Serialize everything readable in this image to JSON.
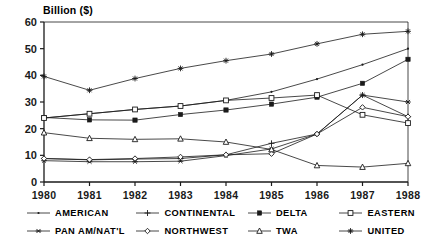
{
  "chart_data": {
    "type": "line",
    "title": "",
    "ylabel": "Billion ($)",
    "xlabel": "",
    "ylim": [
      0,
      60
    ],
    "yticks": [
      0,
      10,
      20,
      30,
      40,
      50,
      60
    ],
    "grid": false,
    "legend_position": "bottom",
    "categories": [
      "1980",
      "1981",
      "1982",
      "1983",
      "1984",
      "1985",
      "1986",
      "1987",
      "1988"
    ],
    "x": [
      1980,
      1981,
      1982,
      1983,
      1984,
      1985,
      1986,
      1987,
      1988
    ],
    "series": [
      {
        "name": "AMERICAN",
        "marker": "dot",
        "values": [
          24.0,
          25.6,
          27.2,
          28.5,
          30.6,
          33.8,
          38.6,
          44.0,
          50.0
        ]
      },
      {
        "name": "CONTINENTAL",
        "marker": "plus",
        "values": [
          8.8,
          8.3,
          8.6,
          8.8,
          10.2,
          14.5,
          18.0,
          32.6,
          24.5
        ]
      },
      {
        "name": "DELTA",
        "marker": "filled-square",
        "values": [
          24.2,
          23.3,
          23.2,
          25.3,
          27.0,
          29.2,
          31.8,
          37.0,
          46.0
        ]
      },
      {
        "name": "EASTERN",
        "marker": "open-square",
        "values": [
          24.0,
          25.6,
          27.2,
          28.5,
          30.6,
          31.5,
          32.6,
          25.2,
          22.1
        ]
      },
      {
        "name": "PAN AM/NAT'L",
        "marker": "asterisk",
        "values": [
          8.0,
          7.6,
          7.6,
          7.8,
          9.9,
          12.4,
          18.0,
          32.6,
          30.0
        ]
      },
      {
        "name": "NORTHWEST",
        "marker": "open-diamond",
        "values": [
          8.8,
          8.4,
          8.8,
          9.4,
          10.2,
          10.6,
          18.0,
          28.0,
          24.5
        ]
      },
      {
        "name": "TWA",
        "marker": "open-triangle",
        "values": [
          18.5,
          16.4,
          16.0,
          16.2,
          15.0,
          12.2,
          6.2,
          5.6,
          7.0
        ]
      },
      {
        "name": "UNITED",
        "marker": "star",
        "values": [
          39.6,
          34.4,
          38.8,
          42.6,
          45.5,
          48.0,
          51.8,
          55.4,
          56.5
        ]
      }
    ]
  },
  "legend": {
    "rows": [
      [
        {
          "label": "AMERICAN",
          "marker": "dot"
        },
        {
          "label": "CONTINENTAL",
          "marker": "plus"
        },
        {
          "label": "DELTA",
          "marker": "filled-square"
        },
        {
          "label": "EASTERN",
          "marker": "open-square"
        }
      ],
      [
        {
          "label": "PAN AM/NAT'L",
          "marker": "asterisk"
        },
        {
          "label": "NORTHWEST",
          "marker": "open-diamond"
        },
        {
          "label": "TWA",
          "marker": "open-triangle"
        },
        {
          "label": "UNITED",
          "marker": "star"
        }
      ]
    ]
  },
  "style": {
    "line_color": "#1a1a1a",
    "axis_color": "#000000",
    "background": "#ffffff"
  }
}
